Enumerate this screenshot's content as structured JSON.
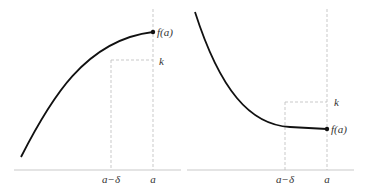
{
  "colors": {
    "curve": "#111111",
    "axis": "#bbbbbb",
    "dashed": "#bbbbbb",
    "text": "#333333"
  },
  "left_panel": {
    "description": "increasing concave curve ending at point (a, f(a)), k below f(a)",
    "labels": {
      "fa": "f(a)",
      "k": "k",
      "a_minus_delta": "a−δ",
      "a": "a"
    }
  },
  "right_panel": {
    "description": "decreasing convex curve ending at point (a, f(a)), k above f(a)",
    "labels": {
      "fa": "f(a)",
      "k": "k",
      "a_minus_delta": "a−δ",
      "a": "a"
    }
  }
}
